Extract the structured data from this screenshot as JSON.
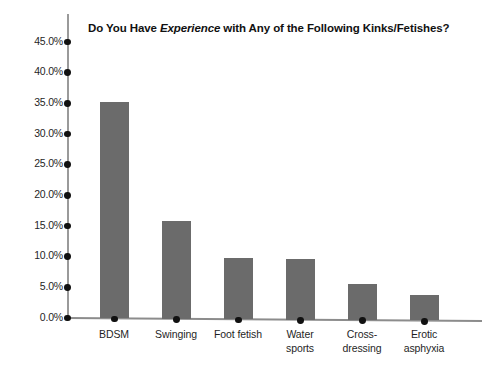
{
  "chart_data": {
    "type": "bar",
    "title": "Do You Have Experience with Any of the Following Kinks/Fetishes?",
    "title_parts": {
      "before": "Do You Have ",
      "emphasis": "Experience",
      "after": " with Any of the Following Kinks/Fetishes?"
    },
    "xlabel": "",
    "ylabel": "",
    "ylim": [
      0,
      45
    ],
    "grid": false,
    "legend": false,
    "bar_color": "#6b6b6b",
    "axis_color": "#9a9a9a",
    "tick_marker_color": "#111111",
    "background": "#ffffff",
    "categories": [
      "BDSM",
      "Swinging",
      "Foot fetish",
      "Water sports",
      "Cross-dressing",
      "Erotic asphyxia"
    ],
    "category_label_lines": [
      [
        "BDSM"
      ],
      [
        "Swinging"
      ],
      [
        "Foot fetish"
      ],
      [
        "Water",
        "sports"
      ],
      [
        "Cross-",
        "dressing"
      ],
      [
        "Erotic",
        "asphyxia"
      ]
    ],
    "values": [
      35.3,
      16.0,
      10.0,
      9.9,
      5.8,
      4.2
    ],
    "yticks": [
      0,
      5,
      10,
      15,
      20,
      25,
      30,
      35,
      40,
      45
    ],
    "ytick_labels": [
      "0.0%",
      "5.0%",
      "10.0%",
      "15.0%",
      "20.0%",
      "25.0%",
      "30.0%",
      "35.0%",
      "40.0%",
      "45.0%"
    ]
  }
}
